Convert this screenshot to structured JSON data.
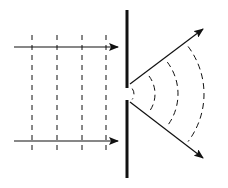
{
  "diagram": {
    "colors": {
      "stroke": "#111111",
      "background": "#ffffff"
    },
    "barrier": {
      "x": 127,
      "top": 10,
      "slit_top": 88,
      "slit_bottom": 100,
      "bottom": 178,
      "width": 3
    },
    "incident_rays": [
      {
        "x1": 14,
        "y1": 47,
        "x2": 118,
        "y2": 47
      },
      {
        "x1": 14,
        "y1": 141,
        "x2": 118,
        "y2": 141
      }
    ],
    "wavefronts_plane_x": [
      32,
      57,
      82,
      106
    ],
    "wavefront_range": {
      "y1": 35,
      "y2": 153
    },
    "diffracted_rays": [
      {
        "x1": 130,
        "y1": 84,
        "x2": 203,
        "y2": 29
      },
      {
        "x1": 130,
        "y1": 102,
        "x2": 203,
        "y2": 158
      }
    ],
    "circular_wavefronts_radii": [
      9,
      30,
      53,
      79
    ],
    "wave_center": {
      "x": 125,
      "y": 94
    }
  }
}
